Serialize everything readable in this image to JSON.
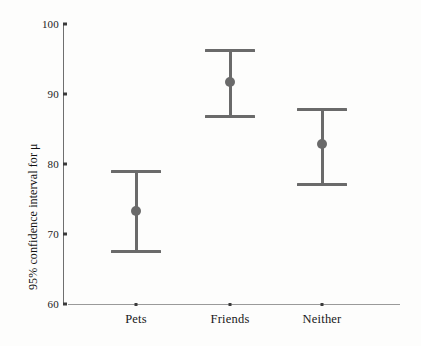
{
  "chart_data": {
    "type": "scatter",
    "title": "",
    "subtitle": "",
    "xlabel": "",
    "ylabel": "95% confidence interval for μ",
    "categories": [
      "Pets",
      "Friends",
      "Neither"
    ],
    "ylim": [
      60,
      100
    ],
    "yticks": [
      60,
      70,
      80,
      90,
      100
    ],
    "ytick_labels": [
      "60",
      "70",
      "80",
      "90",
      "100"
    ],
    "grid": false,
    "legend": null,
    "annotations": [],
    "series": [
      {
        "name": "95% confidence interval for μ",
        "marker": "circle",
        "color": "#6a6a6a",
        "points": [
          {
            "category": "Pets",
            "mean": 73.3,
            "lower": 67.7,
            "upper": 79.1
          },
          {
            "category": "Friends",
            "mean": 91.7,
            "lower": 87.0,
            "upper": 96.4
          },
          {
            "category": "Neither",
            "mean": 82.9,
            "lower": 77.3,
            "upper": 88.0
          }
        ]
      }
    ]
  },
  "style": {
    "bar_color": "#6a6a6a",
    "axis_color": "#6f6f6f",
    "x_axis_color": "#9a9a9a",
    "text_color": "#181818",
    "background": "#fdfdfc"
  },
  "geometry": {
    "plot_left": 63,
    "plot_right": 400,
    "y_top_px": 24,
    "y_bottom_px": 304,
    "y_top_value": 100,
    "y_bottom_value": 60,
    "x_positions": [
      136,
      230,
      322
    ],
    "cap_width": 50
  }
}
